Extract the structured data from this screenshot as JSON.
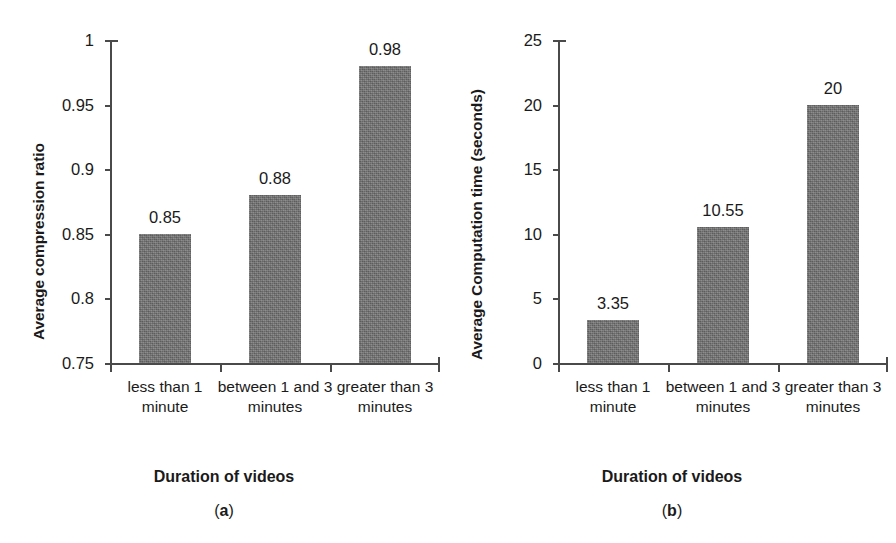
{
  "figure": {
    "background": "#ffffff",
    "bar_color": "#6f6f6f",
    "axis_color": "#4a4a4a",
    "text_color": "#1a1a1a"
  },
  "panel_a": {
    "caption": "(a)",
    "caption_prefix": "(",
    "caption_letter": "a",
    "caption_suffix": ")",
    "xtitle": "Duration of videos",
    "ytitle": "Average compression ratio",
    "yticks": [
      "1",
      "0.95",
      "0.9",
      "0.85",
      "0.8",
      "0.75"
    ],
    "categories": [
      "less than 1 minute",
      "between 1 and 3 minutes",
      "greater than 3 minutes"
    ],
    "bar_labels": [
      "0.85",
      "0.88",
      "0.98"
    ]
  },
  "panel_b": {
    "caption": "(b)",
    "caption_prefix": "(",
    "caption_letter": "b",
    "caption_suffix": ")",
    "xtitle": "Duration of videos",
    "ytitle": "Average Computation time (seconds)",
    "yticks": [
      "25",
      "20",
      "15",
      "10",
      "5",
      "0"
    ],
    "categories": [
      "less than 1 minute",
      "between 1 and 3 minutes",
      "greater than 3 minutes"
    ],
    "bar_labels": [
      "3.35",
      "10.55",
      "20"
    ]
  },
  "chart_data": [
    {
      "type": "bar",
      "panel": "(a)",
      "title": "",
      "categories": [
        "less than 1 minute",
        "between 1 and 3 minutes",
        "greater than 3 minutes"
      ],
      "values": [
        0.85,
        0.88,
        0.98
      ],
      "data_labels": [
        "0.85",
        "0.88",
        "0.98"
      ],
      "xlabel": "Duration of videos",
      "ylabel": "Average compression ratio",
      "ylim": [
        0.75,
        1.0
      ],
      "ytick_values": [
        0.75,
        0.8,
        0.85,
        0.9,
        0.95,
        1.0
      ],
      "ytick_labels": [
        "0.75",
        "0.8",
        "0.85",
        "0.9",
        "0.95",
        "1"
      ],
      "grid": false,
      "legend": false,
      "bar_color": "#6f6f6f"
    },
    {
      "type": "bar",
      "panel": "(b)",
      "title": "",
      "categories": [
        "less than 1 minute",
        "between 1 and 3 minutes",
        "greater than 3 minutes"
      ],
      "values": [
        3.35,
        10.55,
        20
      ],
      "data_labels": [
        "3.35",
        "10.55",
        "20"
      ],
      "xlabel": "Duration of videos",
      "ylabel": "Average Computation time (seconds)",
      "ylim": [
        0,
        25
      ],
      "ytick_values": [
        0,
        5,
        10,
        15,
        20,
        25
      ],
      "ytick_labels": [
        "0",
        "5",
        "10",
        "15",
        "20",
        "25"
      ],
      "grid": false,
      "legend": false,
      "bar_color": "#6f6f6f"
    }
  ]
}
